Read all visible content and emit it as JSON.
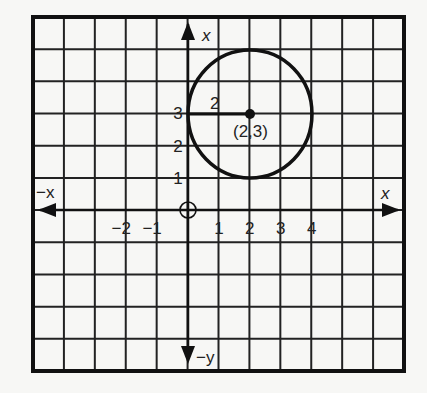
{
  "diagram": {
    "type": "coordinate-grid-circle",
    "grid": {
      "columns": 12,
      "rows": 11
    },
    "axes": {
      "x_positive_label": "x",
      "x_negative_label": "−x",
      "y_positive_label": "x",
      "y_negative_label": "−y",
      "x_ticks": [
        {
          "value": -2,
          "label": "−2"
        },
        {
          "value": -1,
          "label": "−1"
        },
        {
          "value": 1,
          "label": "1"
        },
        {
          "value": 2,
          "label": "2"
        },
        {
          "value": 3,
          "label": "3"
        },
        {
          "value": 4,
          "label": "4"
        }
      ],
      "y_ticks": [
        {
          "value": 1,
          "label": "1"
        },
        {
          "value": 2,
          "label": "2"
        },
        {
          "value": 3,
          "label": "3"
        }
      ]
    },
    "circle": {
      "center": [
        2,
        3
      ],
      "radius": 2,
      "center_label": "(2,3)",
      "radius_label": "2"
    }
  }
}
